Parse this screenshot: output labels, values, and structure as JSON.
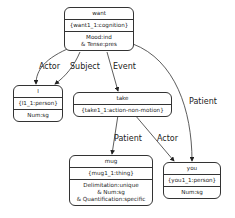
{
  "nodes": {
    "want": {
      "title": "want",
      "id": "{want1_1:cognition}",
      "features": [
        "Mood:ind",
        "& Tense:pres"
      ]
    },
    "i": {
      "title": "I",
      "id": "{I1_1:person}",
      "features": [
        "Num:sg"
      ]
    },
    "take": {
      "title": "take",
      "id": "{take1_1:action-non-motion}",
      "features": []
    },
    "mug": {
      "title": "mug",
      "id": "{mug1_1:thing}",
      "features": [
        "Delimitation:unique",
        "& Num:sg",
        "& Quantification:specific"
      ]
    },
    "you": {
      "title": "you",
      "id": "{you1_1:person}",
      "features": [
        "Num:sg"
      ]
    }
  },
  "edges": [
    {
      "from": "want",
      "to": "i",
      "label": "Actor"
    },
    {
      "from": "want",
      "to": "i",
      "label": "Subject"
    },
    {
      "from": "want",
      "to": "take",
      "label": "Event"
    },
    {
      "from": "want",
      "to": "you",
      "label": "Patient"
    },
    {
      "from": "take",
      "to": "mug",
      "label": "Patient"
    },
    {
      "from": "take",
      "to": "you",
      "label": "Actor"
    }
  ]
}
